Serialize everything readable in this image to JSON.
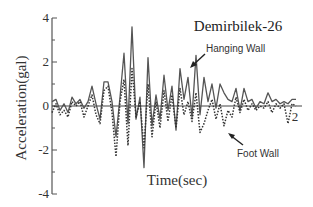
{
  "chart_data": {
    "type": "line",
    "title": "Demirbilek-26",
    "xlabel": "Time(sec)",
    "ylabel": "Acceleration(gal)",
    "ylim": [
      -4,
      4
    ],
    "xlim": [
      0,
      12.5
    ],
    "yticks": [
      4,
      2,
      0,
      -2,
      -4
    ],
    "ytick_labels": [
      "4",
      "2",
      "0",
      "-2",
      "-4"
    ],
    "xticks_visible": [
      12
    ],
    "xtick_labels": [
      "2"
    ],
    "grid": false,
    "zero_line": true,
    "series": [
      {
        "name": "Hanging Wall",
        "style": "solid",
        "x": [
          0,
          0.2,
          0.4,
          0.6,
          0.8,
          1.0,
          1.2,
          1.4,
          1.6,
          1.8,
          2.0,
          2.2,
          2.4,
          2.6,
          2.8,
          3.0,
          3.2,
          3.4,
          3.6,
          3.8,
          4.0,
          4.2,
          4.4,
          4.6,
          4.8,
          5.0,
          5.2,
          5.4,
          5.6,
          5.8,
          6.0,
          6.2,
          6.4,
          6.6,
          6.8,
          7.0,
          7.2,
          7.4,
          7.6,
          7.8,
          8.0,
          8.2,
          8.4,
          8.6,
          8.8,
          9.0,
          9.2,
          9.4,
          9.6,
          9.8,
          10.0,
          10.2,
          10.4,
          10.6,
          10.8,
          11.0,
          11.2,
          11.4,
          11.6,
          11.8,
          12.0,
          12.2
        ],
        "values": [
          0.2,
          0.3,
          -0.2,
          0.1,
          -0.3,
          0.4,
          0.1,
          0.3,
          -0.1,
          0.2,
          0.9,
          0.1,
          -0.6,
          1.1,
          1.1,
          0.2,
          -1.4,
          0.4,
          2.4,
          -0.8,
          3.6,
          -0.6,
          0.4,
          -2.8,
          2.2,
          -0.9,
          0.5,
          -0.6,
          1.4,
          -0.2,
          0.9,
          -1.1,
          1.7,
          0.3,
          1.3,
          -0.5,
          2.3,
          -0.4,
          1.3,
          0.2,
          1.0,
          -0.1,
          1.0,
          0.6,
          0.3,
          0.2,
          0.8,
          -0.2,
          0.8,
          0.2,
          0.3,
          -0.1,
          0.2,
          0.1,
          0.6,
          0.2,
          0.3,
          0.1,
          0.2,
          0.1,
          0.3,
          0.3
        ]
      },
      {
        "name": "Foot Wall",
        "style": "dotted",
        "x": [
          0,
          0.2,
          0.4,
          0.6,
          0.8,
          1.0,
          1.2,
          1.4,
          1.6,
          1.8,
          2.0,
          2.2,
          2.4,
          2.6,
          2.8,
          3.0,
          3.2,
          3.4,
          3.6,
          3.8,
          4.0,
          4.2,
          4.4,
          4.6,
          4.8,
          5.0,
          5.2,
          5.4,
          5.6,
          5.8,
          6.0,
          6.2,
          6.4,
          6.6,
          6.8,
          7.0,
          7.2,
          7.4,
          7.6,
          7.8,
          8.0,
          8.2,
          8.4,
          8.6,
          8.8,
          9.0,
          9.2,
          9.4,
          9.6,
          9.8,
          10.0,
          10.2,
          10.4,
          10.6,
          10.8,
          11.0,
          11.2,
          11.4,
          11.6,
          11.8,
          12.0,
          12.2
        ],
        "values": [
          -0.3,
          0.1,
          -0.4,
          -0.2,
          -0.5,
          0.2,
          0.0,
          0.2,
          -0.5,
          0.0,
          0.5,
          -0.4,
          -0.8,
          0.7,
          0.9,
          -0.3,
          -2.3,
          0.2,
          1.2,
          -1.8,
          1.7,
          -0.5,
          0.2,
          -1.9,
          1.0,
          -1.4,
          0.2,
          -1.0,
          0.7,
          -0.7,
          0.5,
          -1.0,
          0.8,
          -0.4,
          0.2,
          -0.7,
          0.6,
          -1.2,
          -0.8,
          -0.2,
          0.3,
          -0.6,
          0.1,
          -0.9,
          -0.2,
          -0.5,
          0.4,
          -0.3,
          0.3,
          -0.2,
          0.1,
          -0.2,
          0.0,
          -0.1,
          0.2,
          -0.3,
          0.1,
          -0.1,
          0.1,
          -0.8,
          0.1,
          0.0
        ]
      }
    ],
    "annotations": [
      {
        "text": "Hanging Wall",
        "points_to": "Hanging Wall",
        "location": "upper-right"
      },
      {
        "text": "Foot Wall",
        "points_to": "Foot Wall",
        "location": "lower-right"
      }
    ]
  }
}
